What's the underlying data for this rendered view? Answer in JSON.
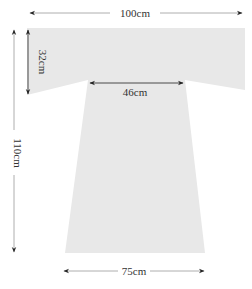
{
  "diagram": {
    "title": "",
    "shape": "T-shaped garment pattern (gray fill)",
    "colors": {
      "fill": "#e8e8e8",
      "line": "#9a9a9a",
      "arrow": "#222222",
      "text": "#333333"
    },
    "dimensions": {
      "top_width": "100cm",
      "sleeve_height": "32cm",
      "neck_width": "46cm",
      "total_length": "110cm",
      "bottom_width": "75cm"
    }
  }
}
